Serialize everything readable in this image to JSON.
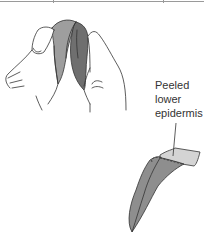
{
  "figure": {
    "label_lines": [
      "Peeled",
      "lower",
      "epidermis"
    ],
    "colors": {
      "outline": "#333333",
      "leaf_light": "#9e9e9e",
      "leaf_dark": "#6f6f6f",
      "epidermis": "#d4d4d4",
      "rule": "#9a9a9a"
    }
  }
}
